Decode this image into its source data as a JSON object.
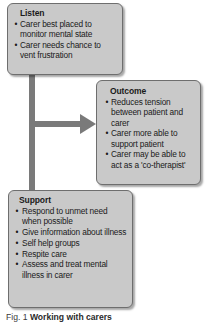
{
  "figure": {
    "caption_label": "Fig. 1",
    "caption_text": "Working with carers",
    "bullet_glyph": "•",
    "colors": {
      "box_fill": "#c9c9c9",
      "box_border": "#6e6e6e",
      "connector": "#7a7a7a",
      "text": "#1a1a1a",
      "background": "#ffffff"
    }
  },
  "nodes": {
    "listen": {
      "title": "Listen",
      "items": [
        "Carer best placed to monitor mental state",
        "Carer needs chance to vent frustration"
      ]
    },
    "outcome": {
      "title": "Outcome",
      "items": [
        "Reduces tension between patient and carer",
        "Carer more able to support patient",
        "Carer may be able to act as a 'co-therapist'"
      ]
    },
    "support": {
      "title": "Support",
      "items": [
        "Respond to unmet need when possible",
        "Give information about illness",
        "Self help groups",
        "Respite care",
        "Assess and treat mental illness in carer"
      ]
    }
  },
  "connectors": [
    {
      "name": "listen-to-outcome-arrow",
      "from": "listen",
      "to": "outcome",
      "style": "elbow-arrow"
    },
    {
      "name": "spine-to-support-line",
      "from": "listen",
      "to": "support",
      "style": "vertical-line"
    }
  ]
}
